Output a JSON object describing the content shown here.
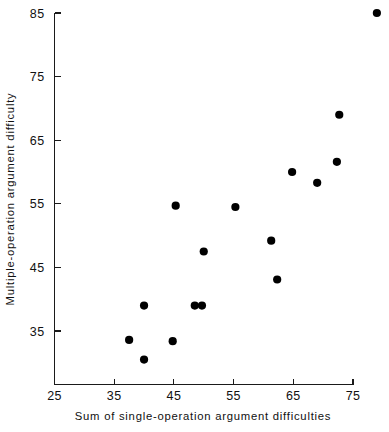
{
  "chart_data": {
    "type": "scatter",
    "title": "",
    "xlabel": "Sum of single-operation argument difficulties",
    "ylabel": "Multiple-operation argument difficulty",
    "xlim": [
      25,
      79.5
    ],
    "ylim": [
      28.5,
      85.5
    ],
    "xticks": [
      25,
      35,
      45,
      55,
      65,
      75
    ],
    "xticklabels": [
      "25",
      "35",
      "45",
      "55",
      "65",
      "75"
    ],
    "yticks": [
      35,
      45,
      55,
      65,
      75,
      85
    ],
    "yticklabels": [
      "35",
      "45",
      "55",
      "65",
      "75",
      "85"
    ],
    "grid": false,
    "legend": null,
    "marker": "filled-circle",
    "marker_color": "#000000",
    "points": [
      {
        "x": 37.5,
        "y": 33.6
      },
      {
        "x": 40.0,
        "y": 39.0
      },
      {
        "x": 40.0,
        "y": 30.5
      },
      {
        "x": 44.8,
        "y": 33.4
      },
      {
        "x": 45.3,
        "y": 54.7
      },
      {
        "x": 48.5,
        "y": 39.0
      },
      {
        "x": 49.7,
        "y": 39.0
      },
      {
        "x": 50.0,
        "y": 47.5
      },
      {
        "x": 55.3,
        "y": 54.5
      },
      {
        "x": 61.3,
        "y": 49.2
      },
      {
        "x": 62.3,
        "y": 43.1
      },
      {
        "x": 64.8,
        "y": 60.0
      },
      {
        "x": 69.0,
        "y": 58.3
      },
      {
        "x": 72.3,
        "y": 61.6
      },
      {
        "x": 72.7,
        "y": 69.0
      },
      {
        "x": 79.0,
        "y": 85.0
      }
    ]
  },
  "axes": {
    "x_title": "Sum of single-operation argument difficulties",
    "y_title": "Multiple-operation argument difficulty"
  },
  "colors": {
    "axis": "#1a1a1a",
    "marker": "#000000",
    "background": "#ffffff"
  }
}
